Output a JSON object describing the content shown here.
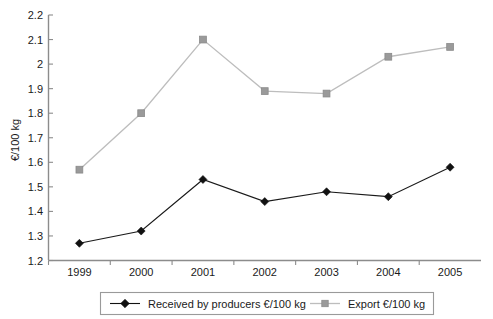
{
  "chart_data": {
    "type": "line",
    "title": "",
    "xlabel": "",
    "ylabel": "€/100 kg",
    "categories": [
      "1999",
      "2000",
      "2001",
      "2002",
      "2003",
      "2004",
      "2005"
    ],
    "ylim": [
      1.2,
      2.2
    ],
    "ytick_step": 0.1,
    "yticks": [
      "1.2",
      "1.3",
      "1.4",
      "1.5",
      "1.6",
      "1.7",
      "1.8",
      "1.9",
      "2",
      "2.1",
      "2.2"
    ],
    "ytick_values": [
      1.2,
      1.3,
      1.4,
      1.5,
      1.6,
      1.7,
      1.8,
      1.9,
      2.0,
      2.1,
      2.2
    ],
    "grid": false,
    "legend_position": "bottom",
    "series": [
      {
        "name": "Received by producers €/100 kg",
        "marker": "diamond",
        "color": "#111111",
        "values": [
          1.27,
          1.32,
          1.53,
          1.44,
          1.48,
          1.46,
          1.58
        ]
      },
      {
        "name": "Export €/100 kg",
        "marker": "square",
        "color": "#9a9a9a",
        "values": [
          1.57,
          1.8,
          2.1,
          1.89,
          1.88,
          2.03,
          2.07
        ]
      }
    ]
  },
  "legend": {
    "items": [
      {
        "label": "Received by producers €/100 kg",
        "marker": "diamond-marker-icon"
      },
      {
        "label": "Export €/100 kg",
        "marker": "square-marker-icon"
      }
    ]
  },
  "colors": {
    "producers": "#111111",
    "export": "#9a9a9a",
    "axis": "#8c8c8c",
    "text": "#1a1a1a",
    "background": "#ffffff"
  }
}
